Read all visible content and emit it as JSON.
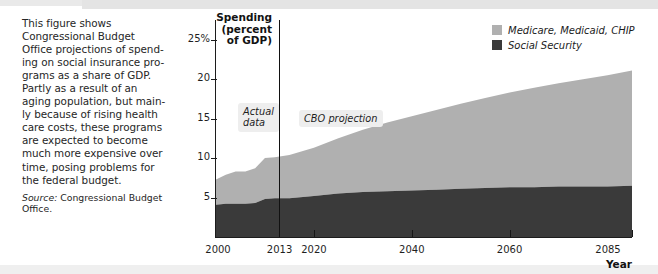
{
  "caption": {
    "body": "This figure shows\nCongressional Budget\nOffice projections of spend-\ning on social insurance pro-\ngrams as a share of GDP.\nPartly as a result of an\naging population, but main-\nly because of rising health\ncare costs, these programs\nare expected to become\nmuch more expensive over\ntime, posing problems for\nthe federal budget.",
    "source_label": "Source:",
    "source_text": " Congressional Budget\nOffice."
  },
  "legend": {
    "items": [
      {
        "label": "Medicare, Medicaid, CHIP",
        "color": "#b0b0b0"
      },
      {
        "label": "Social Security",
        "color": "#3a3a3a"
      }
    ]
  },
  "annotations": [
    {
      "name": "actual-data",
      "text": "Actual\ndata"
    },
    {
      "name": "cbo-projection",
      "text": "CBO projection"
    }
  ],
  "chart_data": {
    "type": "area",
    "title": "",
    "stacked": true,
    "xlabel": "Year",
    "ylabel": "Spending\n(percent\nof GDP)",
    "xlim": [
      2000,
      2085
    ],
    "ylim": [
      0,
      27.5
    ],
    "grid": false,
    "legend_position": "top-right",
    "xticks": [
      2000,
      2013,
      2020,
      2040,
      2060,
      2085
    ],
    "xtick_labels": [
      "2000",
      "2013",
      "2020",
      "2040",
      "2060",
      "2085"
    ],
    "yticks": [
      5,
      10,
      15,
      20,
      25
    ],
    "ytick_labels": [
      "5",
      "10",
      "15",
      "20",
      "25%"
    ],
    "divider_x": 2013,
    "divider_label": "boundary between actual data and CBO projection",
    "x": [
      2000,
      2002,
      2004,
      2006,
      2008,
      2010,
      2012,
      2013,
      2015,
      2020,
      2025,
      2030,
      2035,
      2040,
      2045,
      2050,
      2055,
      2060,
      2065,
      2070,
      2075,
      2080,
      2085
    ],
    "series": [
      {
        "name": "Social Security",
        "color": "#3a3a3a",
        "values": [
          4.1,
          4.2,
          4.2,
          4.2,
          4.3,
          4.8,
          4.9,
          4.9,
          4.9,
          5.2,
          5.5,
          5.7,
          5.8,
          5.9,
          6.0,
          6.1,
          6.2,
          6.3,
          6.3,
          6.4,
          6.4,
          6.4,
          6.5
        ]
      },
      {
        "name": "Medicare, Medicaid, CHIP",
        "color": "#b0b0b0",
        "values": [
          3.2,
          3.7,
          4.1,
          4.1,
          4.4,
          5.2,
          5.2,
          5.3,
          5.5,
          6.1,
          7.0,
          7.9,
          8.7,
          9.4,
          10.1,
          10.8,
          11.4,
          12.0,
          12.6,
          13.1,
          13.6,
          14.1,
          14.6
        ]
      }
    ],
    "totals": [
      7.3,
      7.9,
      8.3,
      8.3,
      8.7,
      10.0,
      10.1,
      10.2,
      10.4,
      11.3,
      12.5,
      13.6,
      14.5,
      15.3,
      16.1,
      16.9,
      17.6,
      18.3,
      18.9,
      19.5,
      20.0,
      20.5,
      21.1
    ]
  }
}
